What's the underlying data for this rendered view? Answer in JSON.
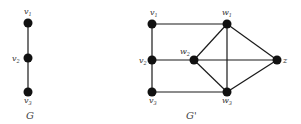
{
  "graphs": [
    {
      "caption": "G",
      "caption_pos": [
        26,
        119
      ],
      "nodes": [
        {
          "id": "v1",
          "label": "v",
          "sub": "1",
          "x": 28,
          "y": 23,
          "lx": 24,
          "ly": 14
        },
        {
          "id": "v2",
          "label": "v",
          "sub": "2",
          "x": 28,
          "y": 58,
          "lx": 12,
          "ly": 61
        },
        {
          "id": "v3",
          "label": "v",
          "sub": "3",
          "x": 28,
          "y": 92,
          "lx": 24,
          "ly": 103
        }
      ],
      "edges": [
        [
          "v1",
          "v2"
        ],
        [
          "v2",
          "v3"
        ]
      ]
    },
    {
      "caption": "G'",
      "caption_pos": [
        186,
        119
      ],
      "nodes": [
        {
          "id": "v1",
          "label": "v",
          "sub": "1",
          "x": 152,
          "y": 24,
          "lx": 150,
          "ly": 15
        },
        {
          "id": "v2",
          "label": "v",
          "sub": "2",
          "x": 152,
          "y": 60,
          "lx": 139,
          "ly": 63
        },
        {
          "id": "v3",
          "label": "v",
          "sub": "3",
          "x": 152,
          "y": 92,
          "lx": 149,
          "ly": 103
        },
        {
          "id": "w1",
          "label": "w",
          "sub": "1",
          "x": 227,
          "y": 24,
          "lx": 222,
          "ly": 15
        },
        {
          "id": "w2",
          "label": "w",
          "sub": "2",
          "x": 194,
          "y": 60,
          "lx": 180,
          "ly": 54
        },
        {
          "id": "w3",
          "label": "w",
          "sub": "3",
          "x": 227,
          "y": 92,
          "lx": 222,
          "ly": 103
        },
        {
          "id": "z",
          "label": "z",
          "sub": "",
          "x": 277,
          "y": 60,
          "lx": 283,
          "ly": 63
        }
      ],
      "edges": [
        [
          "v1",
          "w1"
        ],
        [
          "v1",
          "v2"
        ],
        [
          "v2",
          "v3"
        ],
        [
          "v3",
          "w3"
        ],
        [
          "v2",
          "w2"
        ],
        [
          "w2",
          "w1"
        ],
        [
          "w2",
          "w3"
        ],
        [
          "w2",
          "z"
        ],
        [
          "w1",
          "w3"
        ],
        [
          "w1",
          "z"
        ],
        [
          "w3",
          "z"
        ]
      ]
    }
  ]
}
